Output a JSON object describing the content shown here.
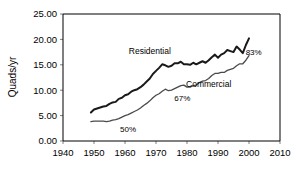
{
  "chart_data": {
    "type": "line",
    "title": "",
    "xlabel": "",
    "ylabel": "Quads/yr",
    "xlim": [
      1940,
      2010
    ],
    "ylim": [
      0,
      25
    ],
    "grid": false,
    "legend_position": "inline-labels",
    "x_ticks": [
      "1940",
      "1950",
      "1960",
      "1970",
      "1980",
      "1990",
      "2000",
      "2010"
    ],
    "y_ticks": [
      "0.00",
      "5.00",
      "10.00",
      "15.00",
      "20.00",
      "25.00"
    ],
    "x_tick_values": [
      1940,
      1950,
      1960,
      1970,
      1980,
      1990,
      2000,
      2010
    ],
    "y_tick_values": [
      0,
      5,
      10,
      15,
      20,
      25
    ],
    "series": [
      {
        "name": "Residential",
        "color": "#1a1a1a",
        "width": 2.0,
        "label_text": "Residential",
        "label_x": 1968,
        "label_y": 17.2,
        "end_annotation": "83%",
        "x": [
          1949,
          1950,
          1951,
          1952,
          1953,
          1954,
          1955,
          1956,
          1957,
          1958,
          1959,
          1960,
          1961,
          1962,
          1963,
          1964,
          1965,
          1966,
          1967,
          1968,
          1969,
          1970,
          1971,
          1972,
          1973,
          1974,
          1975,
          1976,
          1977,
          1978,
          1979,
          1980,
          1981,
          1982,
          1983,
          1984,
          1985,
          1986,
          1987,
          1988,
          1989,
          1990,
          1991,
          1992,
          1993,
          1994,
          1995,
          1996,
          1997,
          1998,
          1999,
          2000
        ],
        "values": [
          5.6,
          6.2,
          6.4,
          6.6,
          6.8,
          6.9,
          7.3,
          7.6,
          7.7,
          8.3,
          8.5,
          9.0,
          9.2,
          9.7,
          10.0,
          10.2,
          10.6,
          11.1,
          11.7,
          12.3,
          13.2,
          13.8,
          14.4,
          15.1,
          14.9,
          14.6,
          14.8,
          15.3,
          15.3,
          15.6,
          15.1,
          15.1,
          15.0,
          15.4,
          15.1,
          15.4,
          15.7,
          15.4,
          15.9,
          16.5,
          17.0,
          16.4,
          17.0,
          17.3,
          17.9,
          17.7,
          17.5,
          18.6,
          18.0,
          17.3,
          18.9,
          20.2
        ]
      },
      {
        "name": "Commercial",
        "color": "#4a4a4a",
        "width": 1.3,
        "label_text": "Commercial",
        "label_x": 1987,
        "label_y": 10.6,
        "end_annotation": "67%",
        "start_annotation": "50%",
        "x": [
          1949,
          1950,
          1951,
          1952,
          1953,
          1954,
          1955,
          1956,
          1957,
          1958,
          1959,
          1960,
          1961,
          1962,
          1963,
          1964,
          1965,
          1966,
          1967,
          1968,
          1969,
          1970,
          1971,
          1972,
          1973,
          1974,
          1975,
          1976,
          1977,
          1978,
          1979,
          1980,
          1981,
          1982,
          1983,
          1984,
          1985,
          1986,
          1987,
          1988,
          1989,
          1990,
          1991,
          1992,
          1993,
          1994,
          1995,
          1996,
          1997,
          1998,
          1999,
          2000
        ],
        "values": [
          3.8,
          3.9,
          3.9,
          3.9,
          3.9,
          3.8,
          3.9,
          4.1,
          4.2,
          4.4,
          4.7,
          5.0,
          5.2,
          5.5,
          5.8,
          6.1,
          6.5,
          7.0,
          7.4,
          7.9,
          8.5,
          9.0,
          9.3,
          9.8,
          10.2,
          9.9,
          10.0,
          10.3,
          10.6,
          10.9,
          11.0,
          10.6,
          10.6,
          10.9,
          11.0,
          11.5,
          11.8,
          11.9,
          12.3,
          12.9,
          13.3,
          13.3,
          13.5,
          13.5,
          13.9,
          14.1,
          14.3,
          14.8,
          15.2,
          15.2,
          15.9,
          16.8
        ]
      }
    ],
    "annotations": [
      {
        "text": "50%",
        "x": 1961,
        "y": 1.8
      },
      {
        "text": "67%",
        "x": 1978.5,
        "y": 7.9
      },
      {
        "text": "83%",
        "x": 2001.5,
        "y": 16.9
      }
    ]
  },
  "plot_geometry": {
    "left": 63,
    "right": 280,
    "top": 14,
    "bottom": 141
  }
}
